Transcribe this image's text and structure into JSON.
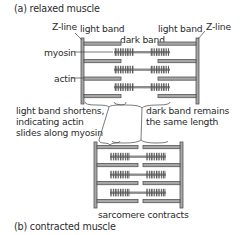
{
  "captions": {
    "relaxed": "(a) relaxed muscle",
    "contracted": "(b) contracted muscle"
  },
  "labels": {
    "z_line_left": "Z-line",
    "z_line_right": "Z-line",
    "light_band_left": "light band",
    "light_band_right": "light band",
    "dark_band": "dark band",
    "myosin": "myosin",
    "actin": "actin",
    "light_band_note": [
      "light band shortens,",
      "indicating actin",
      "slides along myosin"
    ],
    "dark_band_note": [
      "dark band remains",
      "the same length"
    ],
    "sarcomere_contracts": "sarcomere contracts"
  },
  "colors": {
    "stroke": "#555555",
    "fill": "#a6a6a6",
    "myosin_fill": "#8c8c8c",
    "text": "#2b2b2b"
  }
}
